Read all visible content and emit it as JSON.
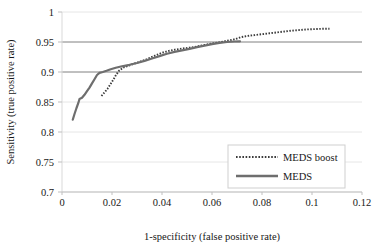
{
  "chart_data": {
    "type": "line",
    "title": "",
    "subtitle": "",
    "xlabel": "1-specificity (false positive rate)",
    "ylabel": "Sensitivity (true positive rate)",
    "xlim": [
      0,
      0.12
    ],
    "ylim": [
      0.7,
      1
    ],
    "xticks": [
      "0",
      "0.02",
      "0.04",
      "0.06",
      "0.08",
      "0.1",
      "0.12"
    ],
    "xtick_values": [
      0,
      0.02,
      0.04,
      0.06,
      0.08,
      0.1,
      0.12
    ],
    "yticks": [
      "0.7",
      "0.75",
      "0.8",
      "0.85",
      "0.9",
      "0.95",
      "1"
    ],
    "ytick_values": [
      0.7,
      0.75,
      0.8,
      0.85,
      0.9,
      0.95,
      1
    ],
    "grid": "horizontal",
    "legend_position": "inside-lower-right",
    "series": [
      {
        "name": "MEDS boost",
        "style": "dotted",
        "color": "#3b3b3b",
        "points": [
          [
            0.0158,
            0.86
          ],
          [
            0.017,
            0.866
          ],
          [
            0.0182,
            0.872
          ],
          [
            0.0193,
            0.879
          ],
          [
            0.0205,
            0.887
          ],
          [
            0.0216,
            0.895
          ],
          [
            0.0228,
            0.902
          ],
          [
            0.0245,
            0.9075
          ],
          [
            0.0265,
            0.9105
          ],
          [
            0.0285,
            0.9135
          ],
          [
            0.031,
            0.917
          ],
          [
            0.034,
            0.9215
          ],
          [
            0.037,
            0.927
          ],
          [
            0.04,
            0.932
          ],
          [
            0.043,
            0.9355
          ],
          [
            0.0455,
            0.9375
          ],
          [
            0.048,
            0.939
          ],
          [
            0.051,
            0.9405
          ],
          [
            0.054,
            0.9425
          ],
          [
            0.057,
            0.945
          ],
          [
            0.06,
            0.9475
          ],
          [
            0.063,
            0.9495
          ],
          [
            0.066,
            0.952
          ],
          [
            0.069,
            0.9545
          ],
          [
            0.0715,
            0.958
          ],
          [
            0.074,
            0.96
          ],
          [
            0.077,
            0.9615
          ],
          [
            0.08,
            0.963
          ],
          [
            0.083,
            0.9645
          ],
          [
            0.086,
            0.966
          ],
          [
            0.089,
            0.9675
          ],
          [
            0.092,
            0.969
          ],
          [
            0.095,
            0.97
          ],
          [
            0.098,
            0.971
          ],
          [
            0.101,
            0.9715
          ],
          [
            0.104,
            0.972
          ],
          [
            0.107,
            0.9722
          ]
        ]
      },
      {
        "name": "MEDS",
        "style": "solid",
        "color": "#6e6e6e",
        "points": [
          [
            0.0043,
            0.8205
          ],
          [
            0.005,
            0.83
          ],
          [
            0.0058,
            0.84
          ],
          [
            0.0065,
            0.848
          ],
          [
            0.007,
            0.855
          ],
          [
            0.008,
            0.857
          ],
          [
            0.009,
            0.862
          ],
          [
            0.01,
            0.868
          ],
          [
            0.011,
            0.874
          ],
          [
            0.012,
            0.881
          ],
          [
            0.013,
            0.888
          ],
          [
            0.014,
            0.895
          ],
          [
            0.015,
            0.8985
          ],
          [
            0.0163,
            0.9
          ],
          [
            0.0178,
            0.902
          ],
          [
            0.0195,
            0.9045
          ],
          [
            0.0215,
            0.907
          ],
          [
            0.024,
            0.9095
          ],
          [
            0.027,
            0.912
          ],
          [
            0.03,
            0.915
          ],
          [
            0.033,
            0.9185
          ],
          [
            0.036,
            0.9225
          ],
          [
            0.039,
            0.9265
          ],
          [
            0.042,
            0.9305
          ],
          [
            0.045,
            0.9335
          ],
          [
            0.048,
            0.936
          ],
          [
            0.051,
            0.9385
          ],
          [
            0.054,
            0.9415
          ],
          [
            0.057,
            0.944
          ],
          [
            0.06,
            0.9465
          ],
          [
            0.063,
            0.9485
          ],
          [
            0.066,
            0.95
          ],
          [
            0.069,
            0.9508
          ],
          [
            0.0712,
            0.9512
          ]
        ]
      }
    ]
  },
  "legend": {
    "items": [
      {
        "label": "MEDS boost",
        "style": "dotted"
      },
      {
        "label": "MEDS",
        "style": "solid"
      }
    ]
  },
  "colors": {
    "plot_border": "#d9d9d9",
    "gridline_major": "#808080",
    "gridline_minor": "#e6e6e6",
    "series_boost": "#3b3b3b",
    "series_meds": "#6e6e6e",
    "text": "#171717",
    "background": "#ffffff"
  }
}
